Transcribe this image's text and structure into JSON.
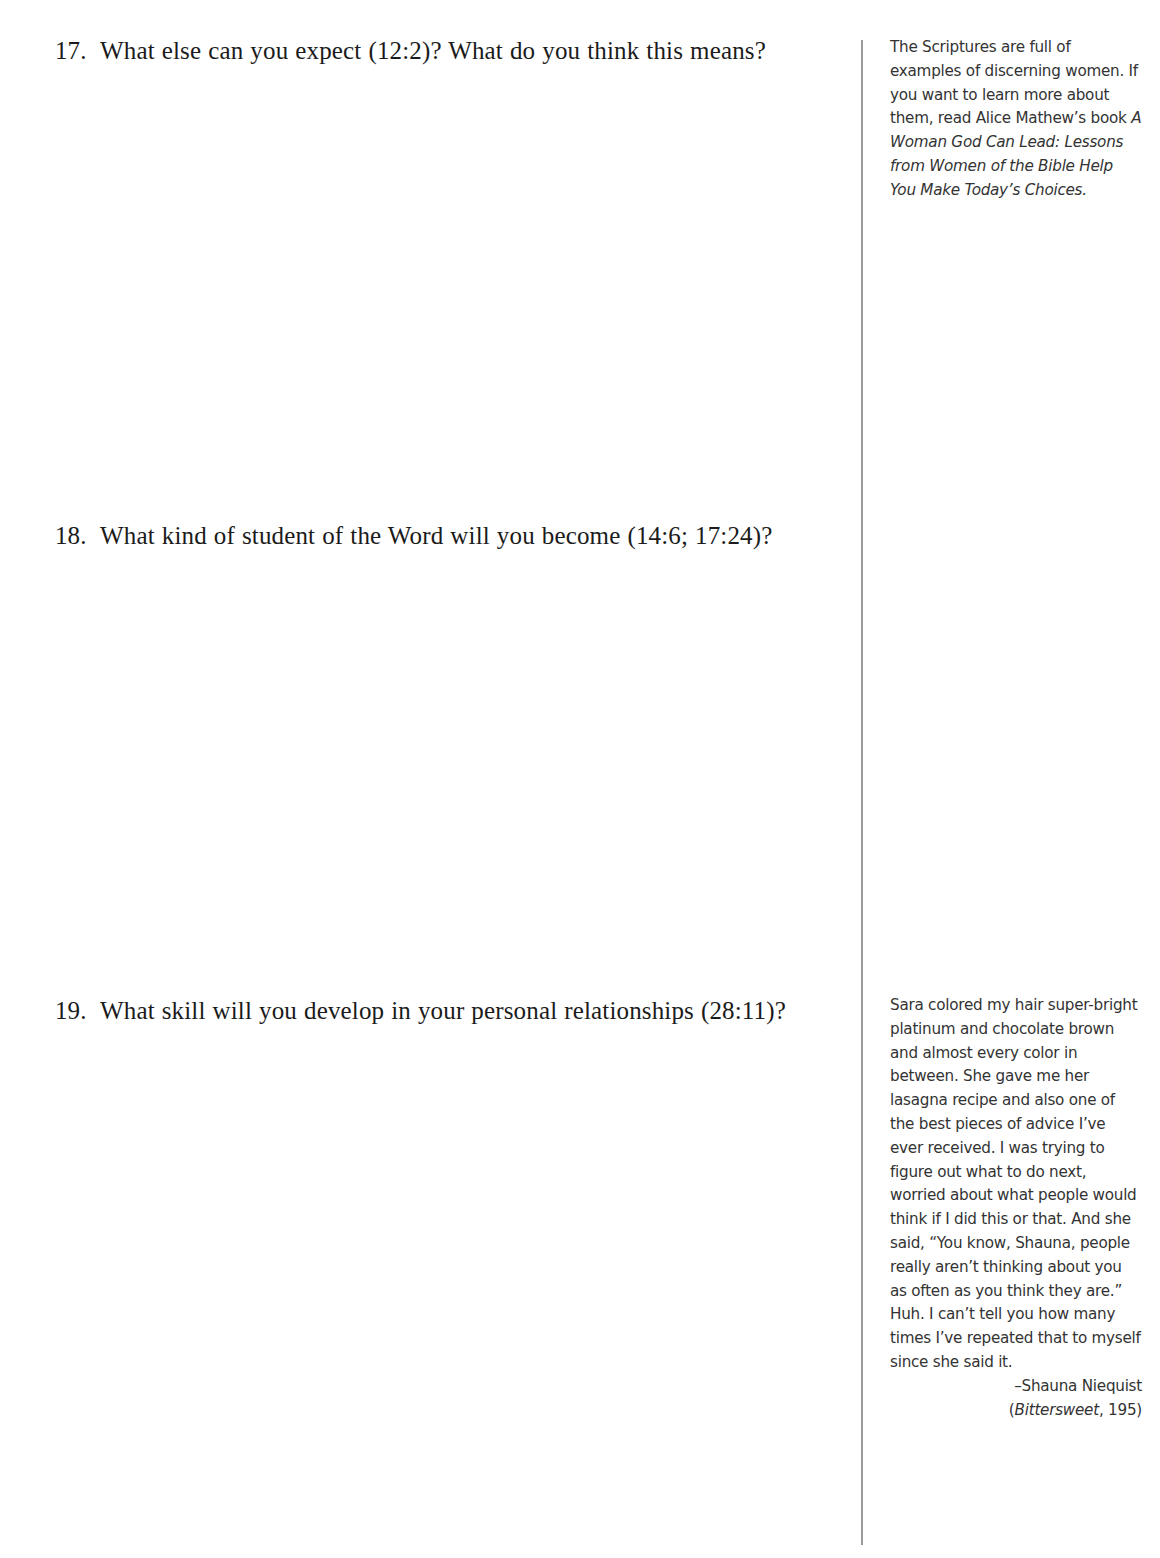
{
  "page": {
    "background_color": "#ffffff",
    "text_color": "#1b1b1b",
    "sidebar_text_color": "#333333",
    "divider_color": "#9a9a9a"
  },
  "questions": [
    {
      "number": "17.",
      "text": "What else can you expect (12:2)? What do you think this means?"
    },
    {
      "number": "18.",
      "text": "What kind of student of the Word will you become (14:6; 17:24)?"
    },
    {
      "number": "19.",
      "text": "What skill will you develop in your personal relationships (28:11)?"
    }
  ],
  "sidebar": {
    "notes": [
      {
        "lead": "The Scriptures are full of examples of discerning women. If you want to learn more about them, read Alice Mathew’s book ",
        "book_title": "A Woman God Can Lead: Lessons from Women of the Bible Help You Make Today’s Choices."
      },
      {
        "quote": "Sara colored my hair super-bright platinum and chocolate brown and almost every color in between. She gave me her lasagna recipe and also one of the best pieces of advice I’ve ever received. I was trying to figure out what to do next, worried about what people would think if I did this or that. And she said, “You know, Shauna, people really aren’t thinking about you as often as you think they are.” Huh. I can’t tell you how many times I’ve repeated that to myself since she said it.",
        "attribution": "–Shauna Niequist",
        "source_title": "Bittersweet",
        "source_page": ", 195)",
        "source_open": "("
      }
    ]
  }
}
